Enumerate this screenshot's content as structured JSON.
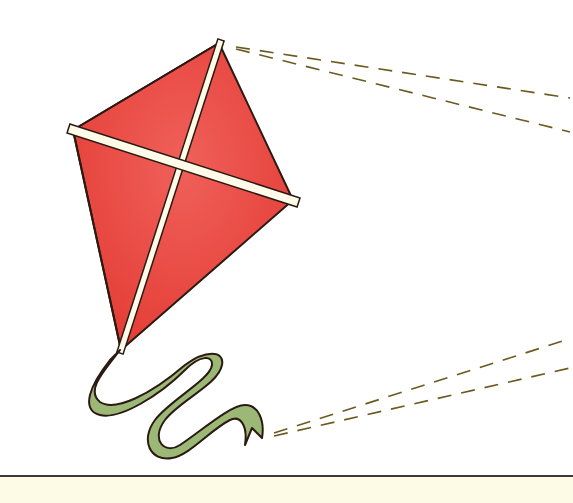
{
  "scene": {
    "subject": "kite",
    "description": "Red diamond kite with white cross spars, green ribbon tail, dashed flight lines"
  },
  "colors": {
    "kite_fill": "#e8423a",
    "kite_fill_light": "#f0605a",
    "spar": "#fffbe8",
    "outline": "#2a1a12",
    "ribbon": "#9cb877",
    "ribbon_dark": "#7e9a5c",
    "dash": "#6b5a20",
    "ground": "#fdfbe6",
    "sky": "#ffffff"
  }
}
